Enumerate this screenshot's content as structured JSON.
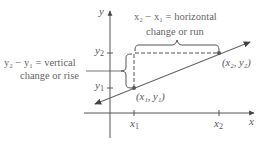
{
  "diagram": {
    "axes": {
      "x_label": "x",
      "y_label": "y"
    },
    "ticks": {
      "x": [
        {
          "label": "x",
          "sub": "1"
        },
        {
          "label": "x",
          "sub": "2"
        }
      ],
      "y": [
        {
          "label": "y",
          "sub": "1"
        },
        {
          "label": "y",
          "sub": "2"
        }
      ]
    },
    "points": [
      {
        "name": "P1",
        "label": "(x₁, y₁)"
      },
      {
        "name": "P2",
        "label": "(x₂, y₂)"
      }
    ],
    "annotations": {
      "horizontal_line1": "x₂ − x₁ = horizontal",
      "horizontal_line2": "change or run",
      "vertical_line1": "y₂ − y₁ = vertical",
      "vertical_line2": "change or rise"
    },
    "colors": {
      "line": "#6a6a6a",
      "axis": "#555555",
      "text": "#666666",
      "point": "#555555"
    }
  }
}
